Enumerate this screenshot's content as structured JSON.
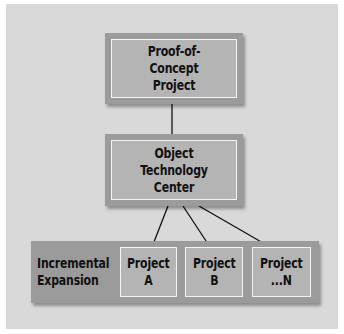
{
  "diagram": {
    "nodes": [
      {
        "id": "poc",
        "label": "Proof-of-Concept\nProject"
      },
      {
        "id": "otc",
        "label": "Object Technology\nCenter"
      }
    ],
    "expansion": {
      "label": "Incremental\nExpansion",
      "projects": [
        {
          "id": "a",
          "label": "Project\nA"
        },
        {
          "id": "b",
          "label": "Project\nB"
        },
        {
          "id": "n",
          "label": "Project\n...N"
        }
      ]
    },
    "edges": [
      {
        "from": "poc",
        "to": "otc"
      },
      {
        "from": "otc",
        "to": "a"
      },
      {
        "from": "otc",
        "to": "b"
      },
      {
        "from": "otc",
        "to": "n"
      }
    ],
    "colors": {
      "background": "#d9d9d9",
      "box_outer": "#9b9b9b",
      "box_inner": "#b4b4b4",
      "inner_border": "#f4f4f4",
      "text": "#111111"
    }
  }
}
